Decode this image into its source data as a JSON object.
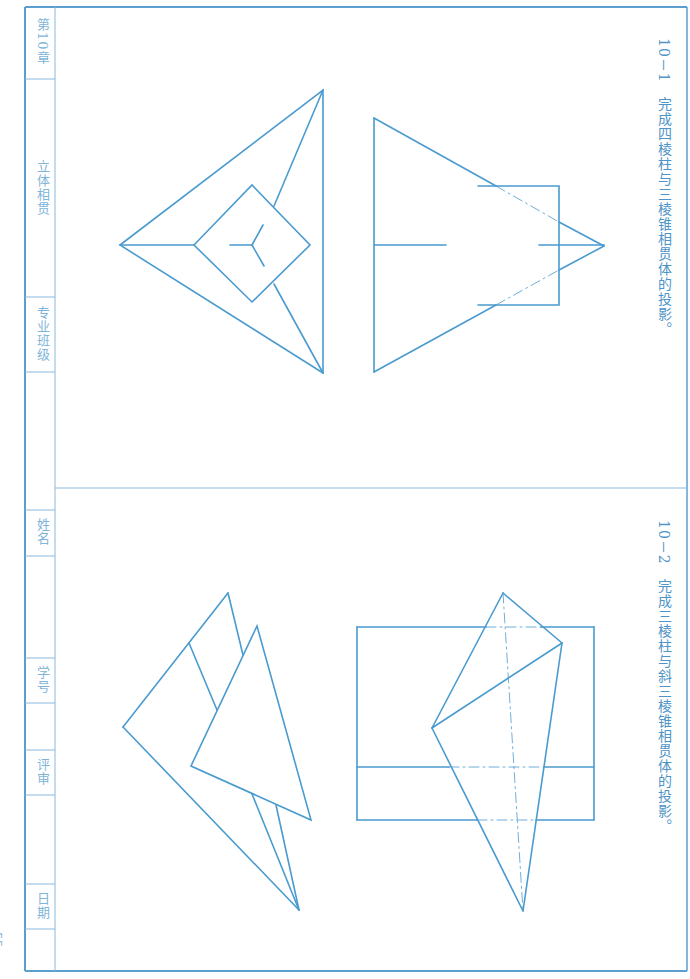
{
  "page": {
    "page_number": "55",
    "line_color": "#4a9bd0",
    "frame_color": "#5a9fd0",
    "text_color": "#4f94c6"
  },
  "sidebar": {
    "cells": [
      {
        "label": "第10章",
        "top": 7,
        "bottom": 79
      },
      {
        "label": "立体相贯",
        "top": 79,
        "bottom": 297
      },
      {
        "label": "专业班级",
        "top": 297,
        "bottom": 372
      },
      {
        "label": "",
        "top": 372,
        "bottom": 510
      },
      {
        "label": "姓名",
        "top": 510,
        "bottom": 556
      },
      {
        "label": "",
        "top": 556,
        "bottom": 658
      },
      {
        "label": "学号",
        "top": 658,
        "bottom": 703
      },
      {
        "label": "",
        "top": 703,
        "bottom": 750
      },
      {
        "label": "评审",
        "top": 750,
        "bottom": 795
      },
      {
        "label": "",
        "top": 795,
        "bottom": 884
      },
      {
        "label": "日期",
        "top": 884,
        "bottom": 929
      },
      {
        "label": "",
        "top": 929,
        "bottom": 971
      }
    ]
  },
  "exercises": [
    {
      "number": "10－1",
      "title": "完成四棱柱与三棱锥相贯体的投影。"
    },
    {
      "number": "10－2",
      "title": "完成三棱柱与斜三棱锥相贯体的投影。"
    }
  ]
}
